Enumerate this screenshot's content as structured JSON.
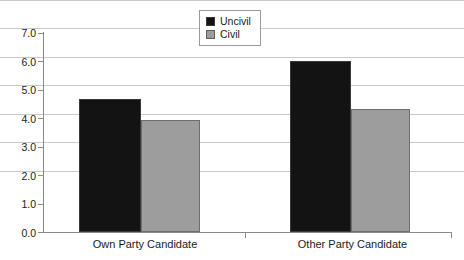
{
  "chart_data": {
    "type": "bar",
    "title": "",
    "subtitle": "",
    "xlabel": "",
    "ylabel": "",
    "ylim": [
      0.0,
      7.0
    ],
    "ytick_interval": 1.0,
    "ytick_labels": [
      "7.0",
      "6.0",
      "5.0",
      "4.0",
      "3.0",
      "2.0",
      "1.0",
      "0.0"
    ],
    "ytick_values": [
      7.0,
      6.0,
      5.0,
      4.0,
      3.0,
      2.0,
      1.0,
      0.0
    ],
    "categories": [
      "Own Party Candidate",
      "Other Party Candidate"
    ],
    "grid": "horizontal",
    "legend_position": "top-center",
    "series": [
      {
        "name": "Uncivil",
        "color": "#131313",
        "values": [
          4.68,
          6.0
        ]
      },
      {
        "name": "Civil",
        "color": "#9d9d9d",
        "values": [
          3.93,
          4.33
        ]
      }
    ],
    "annotations": []
  },
  "colors": {
    "uncivil": "#131313",
    "civil": "#9d9d9d",
    "gridline": "#c9c9c9",
    "axis": "#8a8a8a",
    "text": "#1a1a1a",
    "background": "#ffffff"
  }
}
